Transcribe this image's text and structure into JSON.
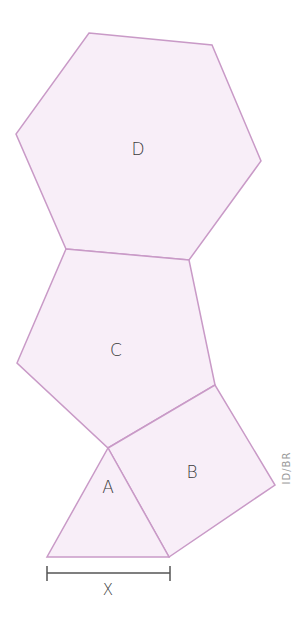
{
  "diagram": {
    "type": "polygon-net",
    "colors": {
      "stroke": "#c99ac7",
      "fill": "#f8eef8",
      "measure": "#555555",
      "text": "#3a3a3a"
    },
    "shapes": [
      {
        "id": "D",
        "kind": "hexagon",
        "label": "D",
        "points": "89,33 212,45 261,161 189,260 66,249 16,134",
        "label_pos": [
          138,
          149
        ]
      },
      {
        "id": "C",
        "kind": "pentagon",
        "label": "C",
        "points": "66,249 189,260 215,385 108,448 17,363",
        "label_pos": [
          116,
          350
        ]
      },
      {
        "id": "B",
        "kind": "square",
        "label": "B",
        "points": "108,448 215,385 275,485 169,557",
        "label_pos": [
          192,
          472
        ]
      },
      {
        "id": "A",
        "kind": "triangle",
        "label": "A",
        "points": "108,448 169,557 47,557",
        "label_pos": [
          108,
          487
        ]
      }
    ],
    "measure": {
      "label": "X",
      "x1": 47,
      "x2": 170,
      "y": 573
    },
    "credit": "ID/BR"
  }
}
